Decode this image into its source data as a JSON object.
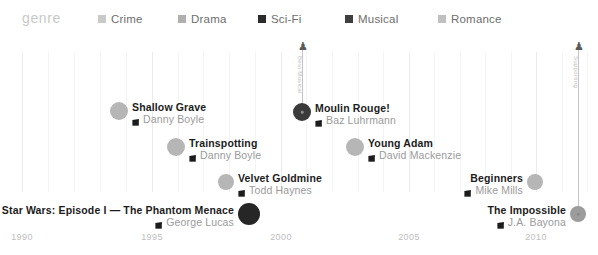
{
  "legend": {
    "title": "genre",
    "items": [
      {
        "label": "Crime",
        "color": "#c9c9c9",
        "x": 98
      },
      {
        "label": "Drama",
        "color": "#b0b0b0",
        "x": 178
      },
      {
        "label": "Sci-Fi",
        "color": "#2b2b2b",
        "x": 258
      },
      {
        "label": "Musical",
        "color": "#3f3f3f",
        "x": 345
      },
      {
        "label": "Romance",
        "color": "#c0c0c0",
        "x": 438
      }
    ]
  },
  "chart_data": {
    "type": "scatter",
    "title": "genre",
    "xlabel": "",
    "ylabel": "",
    "xlim": [
      1989,
      2014
    ],
    "grid": true,
    "legend_position": "top",
    "axis_ticks": [
      {
        "label": "1990",
        "x": 22
      },
      {
        "label": "1995",
        "x": 152
      },
      {
        "label": "2000",
        "x": 281
      },
      {
        "label": "2005",
        "x": 409
      },
      {
        "label": "2010",
        "x": 536
      }
    ],
    "gridlines": [
      {
        "x": 22,
        "minor": false
      },
      {
        "x": 48,
        "minor": true
      },
      {
        "x": 74,
        "minor": true
      },
      {
        "x": 100,
        "minor": true
      },
      {
        "x": 126,
        "minor": true
      },
      {
        "x": 152,
        "minor": false
      },
      {
        "x": 178,
        "minor": true
      },
      {
        "x": 203,
        "minor": true
      },
      {
        "x": 229,
        "minor": true
      },
      {
        "x": 255,
        "minor": true
      },
      {
        "x": 281,
        "minor": false
      },
      {
        "x": 306,
        "minor": true
      },
      {
        "x": 332,
        "minor": true
      },
      {
        "x": 358,
        "minor": true
      },
      {
        "x": 383,
        "minor": true
      },
      {
        "x": 409,
        "minor": false
      },
      {
        "x": 434,
        "minor": true
      },
      {
        "x": 460,
        "minor": true
      },
      {
        "x": 485,
        "minor": true
      },
      {
        "x": 511,
        "minor": true
      },
      {
        "x": 536,
        "minor": false
      },
      {
        "x": 562,
        "minor": true
      },
      {
        "x": 587,
        "minor": true
      }
    ],
    "points": [
      {
        "title": "Shallow Grave",
        "director": "Danny Boyle",
        "genre": "Drama",
        "year": 1994,
        "x": 119,
        "y": 77,
        "color": "#b6b6b6",
        "radius": 9,
        "label_side": "right",
        "award": null
      },
      {
        "title": "Trainspotting",
        "director": "Danny Boyle",
        "genre": "Drama",
        "year": 1996,
        "x": 176,
        "y": 113,
        "color": "#b6b6b6",
        "radius": 9,
        "label_side": "right",
        "award": null
      },
      {
        "title": "Velvet Goldmine",
        "director": "Todd Haynes",
        "genre": "Drama",
        "year": 1998,
        "x": 226,
        "y": 148,
        "color": "#b6b6b6",
        "radius": 8,
        "label_side": "right",
        "award": null
      },
      {
        "title": "Star Wars: Episode I — The Phantom Menace",
        "director": "George Lucas",
        "genre": "Sci-Fi",
        "year": 1999,
        "x": 249,
        "y": 180,
        "color": "#262626",
        "radius": 11,
        "label_side": "left",
        "award": null
      },
      {
        "title": "Moulin Rouge!",
        "director": "Baz Luhrmann",
        "genre": "Musical",
        "year": 2001,
        "x": 302,
        "y": 78,
        "color": "#3a3a3a",
        "radius": 9,
        "label_side": "right",
        "award": {
          "caption": "Best Musical",
          "stem_top": 8,
          "icon": "☰"
        }
      },
      {
        "title": "Young Adam",
        "director": "David Mackenzie",
        "genre": "Drama",
        "year": 2003,
        "x": 355,
        "y": 113,
        "color": "#b6b6b6",
        "radius": 9,
        "label_side": "right",
        "award": null
      },
      {
        "title": "Beginners",
        "director": "Mike Mills",
        "genre": "Drama",
        "year": 2010,
        "x": 535,
        "y": 148,
        "color": "#b6b6b6",
        "radius": 8,
        "label_side": "left",
        "award": null
      },
      {
        "title": "The Impossible",
        "director": "J.A. Bayona",
        "genre": "Drama",
        "year": 2012,
        "x": 578,
        "y": 180,
        "color": "#9c9c9c",
        "radius": 8,
        "label_side": "left",
        "award": {
          "caption": "Supporting",
          "stem_top": 8,
          "icon": "♟"
        }
      }
    ]
  }
}
